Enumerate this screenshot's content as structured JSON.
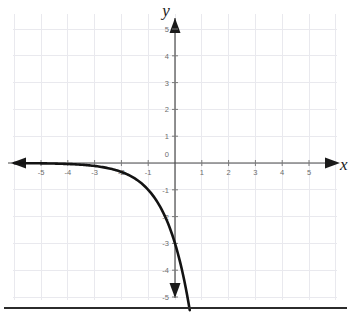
{
  "chart_data": {
    "type": "line",
    "title": "",
    "subtitle": "",
    "xlabel": "x",
    "ylabel": "y",
    "xlim": [
      -6,
      6
    ],
    "ylim": [
      -6,
      6
    ],
    "grid": true,
    "legend": null,
    "x_ticks": [
      -5,
      -4,
      -3,
      -2,
      -1,
      0,
      1,
      2,
      3,
      4,
      5
    ],
    "x_tick_labels": [
      "-5",
      "-4",
      "-3",
      "-2",
      "-1",
      "0",
      "1",
      "2",
      "3",
      "4",
      "5"
    ],
    "y_ticks": [
      -5,
      -4,
      -3,
      -2,
      -1,
      0,
      1,
      2,
      3,
      4,
      5
    ],
    "y_tick_labels": [
      "-5",
      "-4",
      "-3",
      "-2",
      "-1",
      "0",
      "1",
      "2",
      "3",
      "4",
      "5"
    ],
    "origin_label": "0",
    "series": [
      {
        "name": "exponential-decay-reflected",
        "equation": "y = -3 * 3^x",
        "color": "#131313",
        "x": [
          -5.9,
          -5.5,
          -5.0,
          -4.5,
          -4.0,
          -3.5,
          -3.0,
          -2.5,
          -2.0,
          -1.5,
          -1.0,
          -0.75,
          -0.5,
          -0.25,
          0.0,
          0.2,
          0.4,
          0.6,
          0.8,
          1.0
        ],
        "y": [
          -0.013,
          -0.02,
          -0.037,
          -0.064,
          -0.111,
          -0.192,
          -0.333,
          -0.577,
          -1.0,
          -0.577,
          -1.0,
          -1.316,
          -1.732,
          -2.28,
          -3.0,
          -3.85,
          -4.96,
          -6.37,
          -8.18,
          -9.0
        ],
        "key_points": [
          {
            "x": -2,
            "y": -0.33
          },
          {
            "x": -1,
            "y": -1.0
          },
          {
            "x": 0,
            "y": -3.0
          },
          {
            "x": 0.5,
            "y": -5.2
          }
        ],
        "asymptote": "y = 0 as x approaches negative infinity"
      }
    ],
    "annotations": []
  },
  "axes": {
    "x_axis_name": "x",
    "y_axis_name": "y"
  }
}
